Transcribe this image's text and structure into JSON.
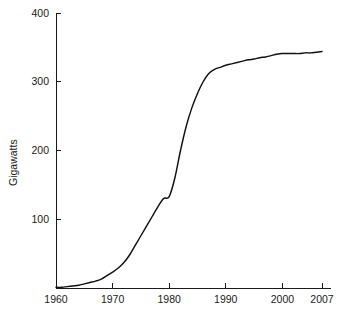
{
  "chart_data": {
    "type": "line",
    "title": "",
    "subtitle": "",
    "xlabel": "",
    "ylabel": "Gigawatts",
    "xlim": [
      1960,
      2007
    ],
    "ylim": [
      0,
      400
    ],
    "grid": false,
    "legend": null,
    "x_ticks": [
      1960,
      1970,
      1980,
      1990,
      2000,
      2007
    ],
    "x_tick_labels": [
      "1960",
      "1970",
      "1980",
      "1990",
      "2000",
      "2007"
    ],
    "y_ticks": [
      100,
      200,
      300,
      400
    ],
    "y_tick_labels": [
      "100",
      "200",
      "300",
      "400"
    ],
    "series": [
      {
        "name": "Installed nuclear capacity",
        "color": "#111111",
        "x": [
          1960,
          1961,
          1962,
          1963,
          1964,
          1965,
          1966,
          1967,
          1968,
          1969,
          1970,
          1971,
          1972,
          1973,
          1974,
          1975,
          1976,
          1977,
          1978,
          1979,
          1980,
          1981,
          1982,
          1983,
          1984,
          1985,
          1986,
          1987,
          1988,
          1989,
          1990,
          1991,
          1992,
          1993,
          1994,
          1995,
          1996,
          1997,
          1998,
          1999,
          2000,
          2001,
          2002,
          2003,
          2004,
          2005,
          2006,
          2007
        ],
        "values": [
          1,
          1,
          2,
          3,
          4,
          6,
          8,
          10,
          13,
          18,
          23,
          29,
          37,
          48,
          62,
          76,
          90,
          104,
          118,
          130,
          133,
          160,
          200,
          235,
          262,
          283,
          300,
          312,
          318,
          321,
          324,
          326,
          328,
          330,
          332,
          333,
          335,
          336,
          338,
          340,
          341,
          341,
          341,
          341,
          342,
          342,
          343,
          344
        ]
      }
    ]
  },
  "figure": {
    "background_color": "#ffffff",
    "axis_color": "#1a1a1a"
  }
}
